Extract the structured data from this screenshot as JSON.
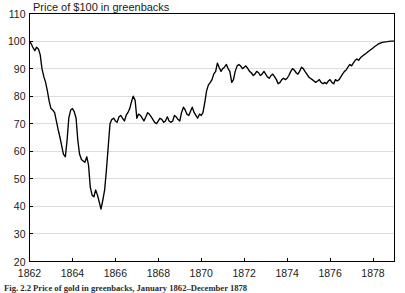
{
  "figure": {
    "caption": "Fig. 2.2   Price of gold in greenbacks, January 1862–December 1878"
  },
  "chart_data": {
    "type": "line",
    "title": "Price of $100 in greenbacks",
    "xlabel": "",
    "ylabel": "",
    "xlim": [
      1862.0,
      1879.0
    ],
    "ylim": [
      20,
      110
    ],
    "xticks": [
      1862,
      1864,
      1866,
      1868,
      1870,
      1872,
      1874,
      1876,
      1878
    ],
    "xtick_labels": [
      "1862",
      "1864",
      "1866",
      "1868",
      "1870",
      "1872",
      "1874",
      "1876",
      "1878"
    ],
    "yticks": [
      20,
      30,
      40,
      50,
      60,
      70,
      80,
      90,
      100,
      110
    ],
    "ytick_labels": [
      "20",
      "30",
      "40",
      "50",
      "60",
      "70",
      "80",
      "90",
      "100",
      "110"
    ],
    "grid": true,
    "grid_axis": "y",
    "legend": false,
    "line_color": "#000000",
    "series": [
      {
        "name": "Price of $100 in greenbacks",
        "x": [
          1862.0,
          1862.08,
          1862.17,
          1862.25,
          1862.33,
          1862.42,
          1862.5,
          1862.58,
          1862.67,
          1862.75,
          1862.83,
          1862.92,
          1863.0,
          1863.08,
          1863.17,
          1863.25,
          1863.33,
          1863.42,
          1863.5,
          1863.58,
          1863.67,
          1863.75,
          1863.83,
          1863.92,
          1864.0,
          1864.08,
          1864.17,
          1864.25,
          1864.33,
          1864.42,
          1864.5,
          1864.58,
          1864.67,
          1864.75,
          1864.83,
          1864.92,
          1865.0,
          1865.08,
          1865.17,
          1865.25,
          1865.33,
          1865.42,
          1865.5,
          1865.58,
          1865.67,
          1865.75,
          1865.83,
          1865.92,
          1866.0,
          1866.08,
          1866.17,
          1866.25,
          1866.33,
          1866.42,
          1866.5,
          1866.58,
          1866.67,
          1866.75,
          1866.83,
          1866.92,
          1867.0,
          1867.08,
          1867.17,
          1867.25,
          1867.33,
          1867.42,
          1867.5,
          1867.58,
          1867.67,
          1867.75,
          1867.83,
          1867.92,
          1868.0,
          1868.08,
          1868.17,
          1868.25,
          1868.33,
          1868.42,
          1868.5,
          1868.58,
          1868.67,
          1868.75,
          1868.83,
          1868.92,
          1869.0,
          1869.08,
          1869.17,
          1869.25,
          1869.33,
          1869.42,
          1869.5,
          1869.58,
          1869.67,
          1869.75,
          1869.83,
          1869.92,
          1870.0,
          1870.08,
          1870.17,
          1870.25,
          1870.33,
          1870.42,
          1870.5,
          1870.58,
          1870.67,
          1870.75,
          1870.83,
          1870.92,
          1871.0,
          1871.08,
          1871.17,
          1871.25,
          1871.33,
          1871.42,
          1871.5,
          1871.58,
          1871.67,
          1871.75,
          1871.83,
          1871.92,
          1872.0,
          1872.08,
          1872.17,
          1872.25,
          1872.33,
          1872.42,
          1872.5,
          1872.58,
          1872.67,
          1872.75,
          1872.83,
          1872.92,
          1873.0,
          1873.08,
          1873.17,
          1873.25,
          1873.33,
          1873.42,
          1873.5,
          1873.58,
          1873.67,
          1873.75,
          1873.83,
          1873.92,
          1874.0,
          1874.08,
          1874.17,
          1874.25,
          1874.33,
          1874.42,
          1874.5,
          1874.58,
          1874.67,
          1874.75,
          1874.83,
          1874.92,
          1875.0,
          1875.08,
          1875.17,
          1875.25,
          1875.33,
          1875.42,
          1875.5,
          1875.58,
          1875.67,
          1875.75,
          1875.83,
          1875.92,
          1876.0,
          1876.08,
          1876.17,
          1876.25,
          1876.33,
          1876.42,
          1876.5,
          1876.58,
          1876.67,
          1876.75,
          1876.83,
          1876.92,
          1877.0,
          1877.08,
          1877.17,
          1877.25,
          1877.33,
          1877.42,
          1877.5,
          1877.58,
          1877.67,
          1877.75,
          1877.83,
          1877.92,
          1878.0,
          1878.08,
          1878.17,
          1878.25,
          1878.33,
          1878.42,
          1878.5,
          1878.58,
          1878.67,
          1878.75,
          1878.83,
          1878.92,
          1879.0
        ],
        "y": [
          100.0,
          99.0,
          97.5,
          96.5,
          97.8,
          97.0,
          95.0,
          90.0,
          87.0,
          85.0,
          82.0,
          78.0,
          75.5,
          75.0,
          74.0,
          71.0,
          68.0,
          65.0,
          62.0,
          59.0,
          58.0,
          64.0,
          72.0,
          75.0,
          75.5,
          74.5,
          72.0,
          64.0,
          59.0,
          57.0,
          56.5,
          56.0,
          58.0,
          55.0,
          47.0,
          44.0,
          43.5,
          46.0,
          44.0,
          41.5,
          39.0,
          42.5,
          46.0,
          53.0,
          62.0,
          70.0,
          71.5,
          72.0,
          71.0,
          70.5,
          72.5,
          73.0,
          72.0,
          71.0,
          73.0,
          74.0,
          75.5,
          78.0,
          80.0,
          78.5,
          72.0,
          73.5,
          73.0,
          72.0,
          71.0,
          72.5,
          74.0,
          73.5,
          72.5,
          71.5,
          70.5,
          70.0,
          71.0,
          72.0,
          71.5,
          70.5,
          71.0,
          72.5,
          71.0,
          70.5,
          71.0,
          73.0,
          72.5,
          71.5,
          71.0,
          74.0,
          76.0,
          75.0,
          73.5,
          73.0,
          74.5,
          76.0,
          74.0,
          73.0,
          72.0,
          73.5,
          73.0,
          74.0,
          78.0,
          82.0,
          84.0,
          85.0,
          86.0,
          88.0,
          89.0,
          92.0,
          90.5,
          89.0,
          90.0,
          90.5,
          91.5,
          90.0,
          89.0,
          85.0,
          86.0,
          89.0,
          91.0,
          91.5,
          91.0,
          90.0,
          90.5,
          91.0,
          90.0,
          89.0,
          88.5,
          87.5,
          88.0,
          89.0,
          88.5,
          87.5,
          88.0,
          89.0,
          88.0,
          87.0,
          86.5,
          87.5,
          88.0,
          87.0,
          86.0,
          84.5,
          85.0,
          86.0,
          86.5,
          86.0,
          86.5,
          87.5,
          89.0,
          90.0,
          89.5,
          88.5,
          88.0,
          89.0,
          90.5,
          90.0,
          89.0,
          88.0,
          87.0,
          86.5,
          86.0,
          85.5,
          85.0,
          85.5,
          86.0,
          85.0,
          84.5,
          85.0,
          84.5,
          85.5,
          86.0,
          85.0,
          84.5,
          86.0,
          85.5,
          86.0,
          87.0,
          88.0,
          89.0,
          89.5,
          90.5,
          91.5,
          91.0,
          92.0,
          93.0,
          93.5,
          93.0,
          94.0,
          94.5,
          95.0,
          95.5,
          96.0,
          96.5,
          97.0,
          97.5,
          98.0,
          98.5,
          99.0,
          99.2,
          99.5,
          99.6,
          99.7,
          99.8,
          99.9,
          100.0,
          100.0,
          100.0
        ]
      }
    ]
  }
}
